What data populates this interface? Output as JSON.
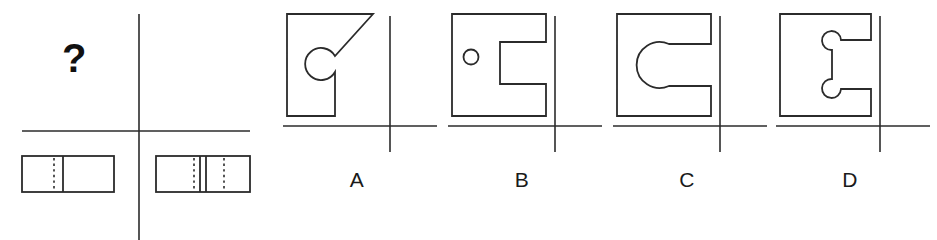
{
  "page": {
    "kind": "orthographic-projection-multiple-choice",
    "background_color": "#ffffff",
    "line_color": "#2b2b2b",
    "text_color": "#1a1a1a"
  },
  "question": {
    "marker": "?",
    "marker_name": "unknown-view-placeholder",
    "projection_axis": {
      "vertical_x": 139,
      "horizontal_y": 131,
      "vertical_from_y": 14,
      "vertical_to_y": 240,
      "horizontal_from_x": 22,
      "horizontal_to_x": 250
    },
    "views": [
      {
        "name": "front-view-left",
        "position": "bottom-left",
        "x": 22,
        "y": 156,
        "width": 92,
        "height": 36,
        "features": [
          {
            "type": "hidden-line",
            "style": "dashed",
            "orientation": "vertical",
            "offset_ratio": 0.35
          },
          {
            "type": "visible-line",
            "style": "solid",
            "orientation": "vertical",
            "offset_ratio": 0.45
          }
        ]
      },
      {
        "name": "side-view-right",
        "position": "bottom-right",
        "x": 156,
        "y": 156,
        "width": 94,
        "height": 36,
        "features": [
          {
            "type": "hidden-line",
            "style": "dashed",
            "orientation": "vertical",
            "offset_ratio": 0.4
          },
          {
            "type": "visible-line",
            "style": "solid",
            "orientation": "vertical",
            "offset_ratio": 0.47
          },
          {
            "type": "visible-line",
            "style": "solid",
            "orientation": "vertical",
            "offset_ratio": 0.53
          },
          {
            "type": "hidden-line",
            "style": "dashed",
            "orientation": "vertical",
            "offset_ratio": 0.72
          }
        ]
      }
    ]
  },
  "options": [
    {
      "id": "A",
      "label": "A",
      "panel_x": 277,
      "shape_name": "diagonal-cut-with-circular-notch",
      "description": "Rectangle with large diagonal chamfer at top-right and a circular notch cut into the body",
      "axis": {
        "vertical_x": 113,
        "horizontal_y": 126
      }
    },
    {
      "id": "B",
      "label": "B",
      "panel_x": 442,
      "shape_name": "rectangular-notch-with-small-hole",
      "description": "Rectangle with a rectangular notch open to the right side and a small round hole on the left",
      "axis": {
        "vertical_x": 113,
        "horizontal_y": 126
      }
    },
    {
      "id": "C",
      "label": "C",
      "panel_x": 607,
      "shape_name": "notch-with-large-arc-end",
      "description": "Rectangle with a slot open to the right ending in a large semicircular arc",
      "axis": {
        "vertical_x": 113,
        "horizontal_y": 126
      }
    },
    {
      "id": "D",
      "label": "D",
      "panel_x": 770,
      "shape_name": "notch-with-two-round-bulges",
      "description": "Rectangle with a slot open to the right having two circular bulges at the inner corners",
      "axis": {
        "vertical_x": 110,
        "horizontal_y": 126
      }
    }
  ]
}
